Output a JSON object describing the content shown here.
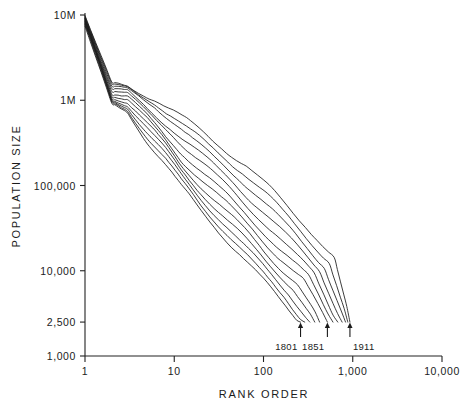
{
  "chart_data": {
    "type": "line",
    "title": "",
    "subtitle": "",
    "xlabel": "RANK ORDER",
    "ylabel": "POPULATION SIZE",
    "xscale": "log",
    "yscale": "log",
    "xlim": [
      1,
      10000
    ],
    "ylim": [
      1000,
      10000000
    ],
    "grid": false,
    "legend_position": "none",
    "xticklabels": [
      "1",
      "10",
      "100",
      "1,000",
      "10,000"
    ],
    "xtickvalues": [
      1,
      10,
      100,
      1000,
      10000
    ],
    "yticklabels": [
      "10M",
      "1M",
      "100,000",
      "10,000",
      "2,500",
      "1,000"
    ],
    "ytickvalues": [
      10000000,
      1000000,
      100000,
      10000,
      2500,
      1000
    ],
    "annotations": [
      {
        "label": "1801",
        "x": 260,
        "y": 2500,
        "note": "arrow to end of earliest curve"
      },
      {
        "label": "1851",
        "x": 520,
        "y": 2500,
        "note": "arrow to end of middle curve"
      },
      {
        "label": "1911",
        "x": 900,
        "y": 2500,
        "note": "arrow to end of latest curve"
      }
    ],
    "series_count": 12,
    "series": [
      {
        "name": "1801",
        "x": [
          1,
          2,
          3,
          5,
          8,
          12,
          20,
          35,
          60,
          100,
          160,
          260
        ],
        "values": [
          7400000,
          880000,
          720000,
          330000,
          175000,
          96000,
          50000,
          26000,
          14000,
          7600,
          4300,
          2500
        ]
      },
      {
        "name": "1811",
        "x": [
          1,
          2,
          3,
          5,
          8,
          12,
          20,
          35,
          60,
          100,
          170,
          290
        ],
        "values": [
          7700000,
          930000,
          780000,
          370000,
          200000,
          112000,
          59000,
          31000,
          16500,
          9000,
          5000,
          2500
        ]
      },
      {
        "name": "1821",
        "x": [
          1,
          2,
          3,
          5,
          8,
          12,
          20,
          35,
          60,
          110,
          190,
          330
        ],
        "values": [
          8000000,
          985000,
          840000,
          415000,
          228000,
          130000,
          70000,
          37000,
          19500,
          10200,
          5600,
          2500
        ]
      },
      {
        "name": "1831",
        "x": [
          1,
          2,
          3,
          5,
          8,
          12,
          20,
          35,
          65,
          120,
          215,
          375
        ],
        "values": [
          8200000,
          1040000,
          900000,
          465000,
          260000,
          150000,
          83000,
          44000,
          22500,
          11500,
          6200,
          2500
        ]
      },
      {
        "name": "1841",
        "x": [
          1,
          2,
          3,
          5,
          8,
          12,
          20,
          36,
          70,
          130,
          240,
          425
        ],
        "values": [
          8400000,
          1100000,
          960000,
          520000,
          296000,
          173000,
          98000,
          52000,
          26500,
          13000,
          6900,
          2500
        ]
      },
      {
        "name": "1851",
        "x": [
          1,
          2,
          3,
          5,
          8,
          12,
          21,
          38,
          75,
          145,
          280,
          520
        ],
        "values": [
          8600000,
          1160000,
          1025000,
          580000,
          336000,
          199000,
          115000,
          62000,
          31000,
          14800,
          7600,
          2500
        ]
      },
      {
        "name": "1861",
        "x": [
          1,
          2,
          3,
          5,
          8,
          13,
          22,
          40,
          80,
          160,
          320,
          600
        ],
        "values": [
          8800000,
          1220000,
          1090000,
          645000,
          380000,
          229000,
          134000,
          74000,
          36500,
          17000,
          8400,
          2500
        ]
      },
      {
        "name": "1871",
        "x": [
          1,
          2,
          3,
          5,
          9,
          14,
          24,
          44,
          88,
          180,
          370,
          680
        ],
        "values": [
          9000000,
          1290000,
          1160000,
          715000,
          430000,
          263000,
          156000,
          88000,
          43000,
          19500,
          9300,
          2500
        ]
      },
      {
        "name": "1881",
        "x": [
          1,
          2,
          3,
          5,
          9,
          15,
          26,
          48,
          97,
          205,
          425,
          760
        ],
        "values": [
          9200000,
          1355000,
          1230000,
          790000,
          485000,
          302000,
          182000,
          104000,
          50500,
          22500,
          10300,
          2500
        ]
      },
      {
        "name": "1891",
        "x": [
          1,
          2,
          3,
          6,
          10,
          16,
          28,
          53,
          108,
          230,
          480,
          830
        ],
        "values": [
          9400000,
          1420000,
          1300000,
          870000,
          545000,
          346000,
          212000,
          123000,
          59500,
          26000,
          11400,
          2500
        ]
      },
      {
        "name": "1901",
        "x": [
          1,
          2,
          3,
          6,
          10,
          17,
          31,
          58,
          120,
          260,
          545,
          880
        ],
        "values": [
          9600000,
          1490000,
          1375000,
          955000,
          612000,
          396000,
          246000,
          145000,
          70000,
          30000,
          12600,
          2500
        ]
      },
      {
        "name": "1911",
        "x": [
          1,
          2,
          3,
          6,
          11,
          19,
          34,
          64,
          133,
          295,
          620,
          930
        ],
        "values": [
          9800000,
          1560000,
          1450000,
          1045000,
          685000,
          452000,
          285000,
          170000,
          82000,
          34500,
          13900,
          2500
        ]
      }
    ]
  }
}
